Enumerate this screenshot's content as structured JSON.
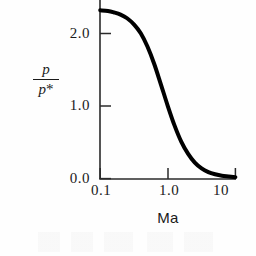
{
  "figure": {
    "background_color": "#fefefe",
    "ink_color": "#141414",
    "curve_color": "#000000"
  },
  "axes": {
    "y_label_numerator": "p",
    "y_label_denominator": "p",
    "y_label_star": "*",
    "x_label": "Ma",
    "y_ticks": [
      "0.0",
      "1.0",
      "2.0"
    ],
    "x_ticks": [
      "0.1",
      "1.0",
      "10"
    ]
  },
  "chart_data": {
    "type": "line",
    "title": "",
    "subtitle": "",
    "xlabel": "Ma",
    "ylabel": "p/p*",
    "xscale": "log",
    "yscale": "linear",
    "xlim": [
      0.1,
      10
    ],
    "ylim": [
      0.0,
      2.5
    ],
    "xticks": [
      0.1,
      1.0,
      10
    ],
    "xticklabels": [
      "0.1",
      "1.0",
      "10"
    ],
    "yticks": [
      0.0,
      1.0,
      2.0
    ],
    "yticklabels": [
      "0.0",
      "1.0",
      "2.0"
    ],
    "grid": false,
    "legend": null,
    "annotations": [],
    "series": [
      {
        "name": "p/p*",
        "linewidth": 4,
        "color": "#000000",
        "x": [
          0.1,
          0.13,
          0.16,
          0.2,
          0.25,
          0.32,
          0.4,
          0.5,
          0.63,
          0.79,
          1.0,
          1.26,
          1.58,
          2.0,
          2.51,
          3.16,
          3.98,
          5.01,
          6.31,
          7.94,
          10.0
        ],
        "y": [
          2.32,
          2.31,
          2.29,
          2.26,
          2.21,
          2.12,
          2.0,
          1.82,
          1.58,
          1.3,
          1.0,
          0.73,
          0.51,
          0.34,
          0.22,
          0.14,
          0.09,
          0.06,
          0.04,
          0.03,
          0.02
        ]
      }
    ]
  }
}
